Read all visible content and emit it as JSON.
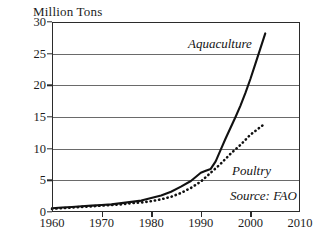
{
  "chart_data": {
    "type": "line",
    "title": "",
    "xlabel": "",
    "ylabel": "Million Tons",
    "xlim": [
      1960,
      2010
    ],
    "ylim": [
      0,
      30
    ],
    "grid": true,
    "legend_position": "inline-annotations",
    "source_note": "Source: FAO",
    "xticks": [
      1960,
      1970,
      1980,
      1990,
      2000,
      2010
    ],
    "yticks": [
      0,
      5,
      10,
      15,
      20,
      25,
      30
    ],
    "series": [
      {
        "name": "Aquaculture",
        "style": "solid",
        "x": [
          1960,
          1962,
          1964,
          1966,
          1968,
          1970,
          1972,
          1974,
          1976,
          1978,
          1980,
          1982,
          1984,
          1986,
          1988,
          1990,
          1991,
          1992,
          1993,
          1994,
          1995,
          1996,
          1997,
          1998,
          1999,
          2000,
          2001,
          2002,
          2003
        ],
        "values": [
          0.6,
          0.7,
          0.8,
          0.9,
          1.0,
          1.1,
          1.2,
          1.4,
          1.6,
          1.8,
          2.2,
          2.6,
          3.2,
          4.0,
          4.9,
          6.2,
          6.5,
          6.8,
          8.0,
          9.8,
          11.6,
          13.3,
          15.0,
          16.8,
          18.8,
          21.0,
          23.4,
          25.8,
          28.2
        ]
      },
      {
        "name": "Poultry",
        "style": "dotted",
        "x": [
          1960,
          1962,
          1964,
          1966,
          1968,
          1970,
          1972,
          1974,
          1976,
          1978,
          1980,
          1982,
          1984,
          1986,
          1988,
          1990,
          1992,
          1994,
          1996,
          1998,
          2000,
          2001,
          2002,
          2003
        ],
        "values": [
          0.5,
          0.6,
          0.7,
          0.8,
          0.9,
          1.0,
          1.1,
          1.2,
          1.4,
          1.5,
          1.7,
          2.0,
          2.4,
          3.0,
          3.8,
          4.8,
          6.2,
          7.6,
          9.2,
          10.6,
          12.2,
          12.8,
          13.4,
          14.0
        ]
      }
    ]
  },
  "annotations": {
    "aquaculture_label": "Aquaculture",
    "poultry_label": "Poultry",
    "source_label": "Source: FAO"
  },
  "colors": {
    "line": "#111111",
    "grid": "#6a6a6a",
    "frame": "#2b2b2b",
    "text": "#1c1c1c",
    "background": "#ffffff"
  }
}
